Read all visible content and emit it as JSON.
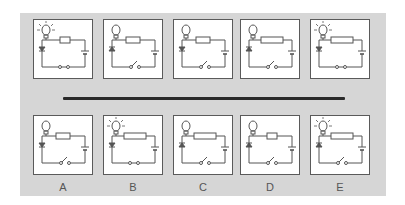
{
  "figure": {
    "type": "circuit-comparison",
    "top_row": [
      {
        "bulb": "lit",
        "resistor": "short",
        "diode": "reverse",
        "switch": "closed"
      },
      {
        "bulb": "unlit",
        "resistor": "medium",
        "diode": "forward",
        "switch": "open"
      },
      {
        "bulb": "unlit",
        "resistor": "medium",
        "diode": "reverse",
        "switch": "open"
      },
      {
        "bulb": "unlit",
        "resistor": "long",
        "diode": "forward",
        "switch": "open"
      },
      {
        "bulb": "lit",
        "resistor": "long",
        "diode": "reverse",
        "switch": "closed"
      }
    ],
    "bottom_row": [
      {
        "label": "A",
        "bulb": "unlit",
        "resistor": "medium",
        "diode": "reverse",
        "switch": "open"
      },
      {
        "label": "B",
        "bulb": "lit",
        "resistor": "long",
        "diode": "reverse",
        "switch": "closed"
      },
      {
        "label": "C",
        "bulb": "unlit",
        "resistor": "long",
        "diode": "forward",
        "switch": "open"
      },
      {
        "label": "D",
        "bulb": "unlit",
        "resistor": "short",
        "diode": "forward",
        "switch": "open"
      },
      {
        "label": "E",
        "bulb": "lit",
        "resistor": "long",
        "diode": "forward",
        "switch": "open"
      }
    ]
  },
  "labels": [
    "A",
    "B",
    "C",
    "D",
    "E"
  ],
  "colors": {
    "panel": "#d6d6d6",
    "box_border": "#5a5a5a",
    "line": "#555555",
    "divider": "#2a2a2a"
  }
}
